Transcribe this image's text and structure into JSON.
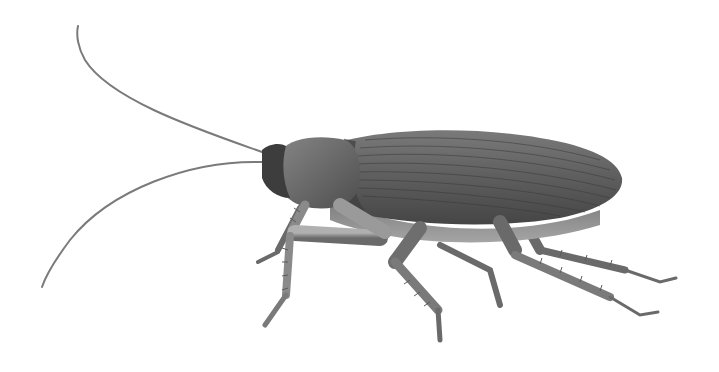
{
  "image": {
    "subject": "cockroach illustration",
    "background": "#ffffff",
    "colors": {
      "body_dark": "#4a4a4a",
      "body_mid": "#6e6e6e",
      "leg_light": "#9a9a9a",
      "leg_dark": "#5a5a5a",
      "antenna": "#7a7a7a"
    }
  }
}
